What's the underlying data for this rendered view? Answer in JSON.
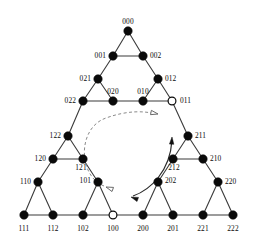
{
  "figure": {
    "background_color": "#ffffff",
    "edge_color": "#3b3b3b",
    "node_fill_color": "#0a0a0a",
    "node_open_color": "#ffffff",
    "dashed_curve_color": "#8a8a8a",
    "solid_curve_color": "#2a2a2a",
    "node_radius": 4.2,
    "width": 261,
    "height": 241
  },
  "nodes": [
    {
      "id": "000",
      "label": "000",
      "x": 128,
      "y": 31,
      "style": "filled",
      "label_dx": 0,
      "label_dy": -7,
      "anchor": "middle"
    },
    {
      "id": "001",
      "label": "001",
      "x": 113,
      "y": 56,
      "style": "filled",
      "label_dx": -7,
      "label_dy": 2,
      "anchor": "end"
    },
    {
      "id": "002",
      "label": "002",
      "x": 143,
      "y": 56,
      "style": "filled",
      "label_dx": 7,
      "label_dy": 2,
      "anchor": "start"
    },
    {
      "id": "021",
      "label": "021",
      "x": 98,
      "y": 79,
      "style": "filled",
      "label_dx": -7,
      "label_dy": 2,
      "anchor": "end"
    },
    {
      "id": "012",
      "label": "012",
      "x": 158,
      "y": 79,
      "style": "filled",
      "label_dx": 7,
      "label_dy": 2,
      "anchor": "start"
    },
    {
      "id": "022",
      "label": "022",
      "x": 83,
      "y": 101,
      "style": "filled",
      "label_dx": -7,
      "label_dy": 2,
      "anchor": "end"
    },
    {
      "id": "020",
      "label": "020",
      "x": 113,
      "y": 101,
      "style": "filled",
      "label_dx": 0,
      "label_dy": -7,
      "anchor": "middle"
    },
    {
      "id": "010",
      "label": "010",
      "x": 143,
      "y": 101,
      "style": "filled",
      "label_dx": 0,
      "label_dy": -7,
      "anchor": "middle"
    },
    {
      "id": "011",
      "label": "011",
      "x": 172,
      "y": 101,
      "style": "open",
      "label_dx": 8,
      "label_dy": 2,
      "anchor": "start"
    },
    {
      "id": "122",
      "label": "122",
      "x": 68,
      "y": 136,
      "style": "filled",
      "label_dx": -7,
      "label_dy": 2,
      "anchor": "end"
    },
    {
      "id": "211",
      "label": "211",
      "x": 188,
      "y": 136,
      "style": "filled",
      "label_dx": 7,
      "label_dy": 2,
      "anchor": "start"
    },
    {
      "id": "120",
      "label": "120",
      "x": 53,
      "y": 159,
      "style": "filled",
      "label_dx": -7,
      "label_dy": 2,
      "anchor": "end"
    },
    {
      "id": "121",
      "label": "121",
      "x": 83,
      "y": 159,
      "style": "filled",
      "label_dx": -2,
      "label_dy": 11,
      "anchor": "middle"
    },
    {
      "id": "212",
      "label": "212",
      "x": 173,
      "y": 159,
      "style": "filled",
      "label_dx": 1,
      "label_dy": 11,
      "anchor": "middle"
    },
    {
      "id": "210",
      "label": "210",
      "x": 203,
      "y": 159,
      "style": "filled",
      "label_dx": 7,
      "label_dy": 2,
      "anchor": "start"
    },
    {
      "id": "110",
      "label": "110",
      "x": 38,
      "y": 182,
      "style": "filled",
      "label_dx": -7,
      "label_dy": 2,
      "anchor": "end"
    },
    {
      "id": "101",
      "label": "101",
      "x": 98,
      "y": 182,
      "style": "filled",
      "label_dx": -7,
      "label_dy": 1,
      "anchor": "end"
    },
    {
      "id": "202",
      "label": "202",
      "x": 158,
      "y": 182,
      "style": "filled",
      "label_dx": 7,
      "label_dy": 1,
      "anchor": "start"
    },
    {
      "id": "220",
      "label": "220",
      "x": 218,
      "y": 182,
      "style": "filled",
      "label_dx": 7,
      "label_dy": 2,
      "anchor": "start"
    },
    {
      "id": "111",
      "label": "111",
      "x": 24,
      "y": 215,
      "style": "filled",
      "label_dx": 0,
      "label_dy": 16,
      "anchor": "middle"
    },
    {
      "id": "112",
      "label": "112",
      "x": 53,
      "y": 215,
      "style": "filled",
      "label_dx": 0,
      "label_dy": 16,
      "anchor": "middle"
    },
    {
      "id": "102",
      "label": "102",
      "x": 83,
      "y": 215,
      "style": "filled",
      "label_dx": 0,
      "label_dy": 16,
      "anchor": "middle"
    },
    {
      "id": "100",
      "label": "100",
      "x": 113,
      "y": 215,
      "style": "open",
      "label_dx": 0,
      "label_dy": 16,
      "anchor": "middle"
    },
    {
      "id": "200",
      "label": "200",
      "x": 143,
      "y": 215,
      "style": "filled",
      "label_dx": 0,
      "label_dy": 16,
      "anchor": "middle"
    },
    {
      "id": "201",
      "label": "201",
      "x": 173,
      "y": 215,
      "style": "filled",
      "label_dx": 0,
      "label_dy": 16,
      "anchor": "middle"
    },
    {
      "id": "221",
      "label": "221",
      "x": 203,
      "y": 215,
      "style": "filled",
      "label_dx": 0,
      "label_dy": 16,
      "anchor": "middle"
    },
    {
      "id": "222",
      "label": "222",
      "x": 233,
      "y": 215,
      "style": "filled",
      "label_dx": 0,
      "label_dy": 16,
      "anchor": "middle"
    }
  ],
  "edges": [
    [
      "000",
      "001"
    ],
    [
      "000",
      "002"
    ],
    [
      "001",
      "002"
    ],
    [
      "001",
      "021"
    ],
    [
      "002",
      "012"
    ],
    [
      "021",
      "022"
    ],
    [
      "021",
      "020"
    ],
    [
      "022",
      "020"
    ],
    [
      "012",
      "010"
    ],
    [
      "012",
      "011"
    ],
    [
      "010",
      "011"
    ],
    [
      "020",
      "010"
    ],
    [
      "022",
      "122"
    ],
    [
      "011",
      "211"
    ],
    [
      "122",
      "120"
    ],
    [
      "122",
      "121"
    ],
    [
      "120",
      "121"
    ],
    [
      "211",
      "212"
    ],
    [
      "211",
      "210"
    ],
    [
      "212",
      "210"
    ],
    [
      "120",
      "110"
    ],
    [
      "121",
      "101"
    ],
    [
      "212",
      "202"
    ],
    [
      "210",
      "220"
    ],
    [
      "110",
      "111"
    ],
    [
      "110",
      "112"
    ],
    [
      "111",
      "112"
    ],
    [
      "101",
      "102"
    ],
    [
      "101",
      "100"
    ],
    [
      "102",
      "100"
    ],
    [
      "112",
      "102"
    ],
    [
      "202",
      "200"
    ],
    [
      "202",
      "201"
    ],
    [
      "200",
      "201"
    ],
    [
      "220",
      "221"
    ],
    [
      "220",
      "222"
    ],
    [
      "221",
      "222"
    ],
    [
      "201",
      "221"
    ],
    [
      "100",
      "200"
    ]
  ],
  "annotations": {
    "dashed_path": {
      "name": "dashed-transfer-arc",
      "path": "M 104 186 C 78 176, 77 128, 106 118 C 128 110, 145 111, 156 114",
      "start_arrowhead": {
        "x": 106,
        "y": 187,
        "angle": 200,
        "style": "open"
      },
      "end_arrowhead": {
        "x": 158,
        "y": 114,
        "angle": 12,
        "style": "open"
      }
    },
    "solid_path": {
      "name": "solid-transfer-arc",
      "path": "M 133 196 C 150 190, 170 172, 172 140",
      "start_arrowhead": {
        "x": 131,
        "y": 197,
        "angle": 200,
        "style": "solid"
      },
      "end_arrowhead": {
        "x": 172,
        "y": 137,
        "angle": -87,
        "style": "solid"
      }
    }
  }
}
